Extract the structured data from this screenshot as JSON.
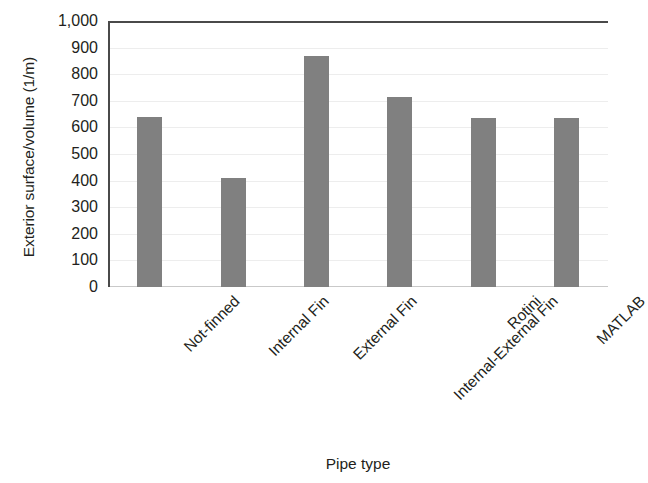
{
  "chart_data": {
    "type": "bar",
    "title": "",
    "subtitle": "",
    "xlabel": "Pipe type",
    "ylabel": "Exterior surface/volume (1/m)",
    "categories": [
      "Not-finned",
      "Internal Fin",
      "External Fin",
      "Internal-External Fin",
      "Rotini",
      "MATLAB"
    ],
    "values": [
      640,
      410,
      870,
      715,
      635,
      635
    ],
    "ylim": [
      0,
      1000
    ],
    "ytick_step": 100,
    "ytick_labels": [
      "1,000",
      "900",
      "800",
      "700",
      "600",
      "500",
      "400",
      "300",
      "200",
      "100",
      "0"
    ],
    "ytick_values": [
      1000,
      900,
      800,
      700,
      600,
      500,
      400,
      300,
      200,
      100,
      0
    ],
    "grid": true,
    "grid_axis": "y",
    "legend": false,
    "legend_position": "none",
    "bar_color": "#808080",
    "axis_color": "#4a4a4a",
    "gridline_color": "#ededed",
    "text_color": "#231f20",
    "background_color": "#ffffff",
    "xtick_rotation": -45
  }
}
